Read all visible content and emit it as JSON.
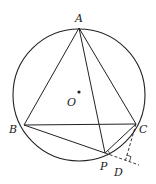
{
  "diagram": {
    "type": "geometry",
    "circle": {
      "center": "O",
      "cx": 79,
      "cy": 95,
      "r": 66
    },
    "points": {
      "A": {
        "label": "A",
        "x": 79,
        "y": 28,
        "lx": 75,
        "ly": 22
      },
      "O": {
        "label": "O",
        "x": 79,
        "y": 92,
        "lx": 67,
        "ly": 106
      },
      "B": {
        "label": "B",
        "x": 24,
        "y": 125,
        "lx": 9,
        "ly": 133
      },
      "C": {
        "label": "C",
        "x": 136,
        "y": 124,
        "lx": 139,
        "ly": 133
      },
      "P": {
        "label": "P",
        "x": 105,
        "y": 153,
        "lx": 100,
        "ly": 170
      },
      "D": {
        "label": "D",
        "x": 126,
        "y": 160,
        "lx": 114,
        "ly": 176
      }
    },
    "segments": [
      {
        "from": "A",
        "to": "B",
        "style": "solid"
      },
      {
        "from": "A",
        "to": "C",
        "style": "solid"
      },
      {
        "from": "B",
        "to": "C",
        "style": "solid"
      },
      {
        "from": "A",
        "to": "P",
        "style": "solid"
      },
      {
        "from": "B",
        "to": "P",
        "style": "solid"
      },
      {
        "from": "P",
        "to": "C",
        "style": "solid"
      },
      {
        "from": "P",
        "to": "D",
        "style": "dashed",
        "extended": true
      },
      {
        "from": "C",
        "to": "D",
        "style": "dashed",
        "extended": true
      }
    ],
    "right_angle_at": "D",
    "colors": {
      "stroke": "#222222",
      "background": "#ffffff"
    }
  }
}
